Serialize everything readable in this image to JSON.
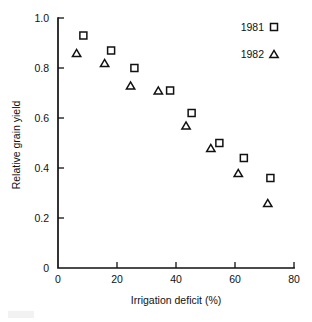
{
  "chart_data": {
    "type": "scatter",
    "title": "",
    "xlabel": "Irrigation deficit (%)",
    "ylabel": "Relative grain yield",
    "xlim": [
      0,
      80
    ],
    "ylim": [
      0,
      1.0
    ],
    "xticks": [
      0,
      20,
      40,
      60,
      80
    ],
    "xtick_labels": [
      "0",
      "20",
      "40",
      "60",
      "80"
    ],
    "yticks": [
      0,
      0.2,
      0.4,
      0.6,
      0.8,
      1.0
    ],
    "ytick_labels": [
      "0",
      "0.2",
      "0.4",
      "0.6",
      "0.8",
      "1.0"
    ],
    "grid": false,
    "legend_position": "top-right",
    "series": [
      {
        "name": "1981",
        "marker": "open-square",
        "points": [
          {
            "x": 8.6,
            "y": 0.93
          },
          {
            "x": 18.0,
            "y": 0.87
          },
          {
            "x": 25.9,
            "y": 0.8
          },
          {
            "x": 38.0,
            "y": 0.71
          },
          {
            "x": 45.3,
            "y": 0.62
          },
          {
            "x": 54.7,
            "y": 0.5
          },
          {
            "x": 63.0,
            "y": 0.44
          },
          {
            "x": 72.0,
            "y": 0.36
          }
        ]
      },
      {
        "name": "1982",
        "marker": "open-triangle",
        "points": [
          {
            "x": 6.3,
            "y": 0.86
          },
          {
            "x": 15.8,
            "y": 0.82
          },
          {
            "x": 24.6,
            "y": 0.73
          },
          {
            "x": 34.0,
            "y": 0.71
          },
          {
            "x": 43.4,
            "y": 0.57
          },
          {
            "x": 51.8,
            "y": 0.48
          },
          {
            "x": 61.1,
            "y": 0.38
          },
          {
            "x": 71.1,
            "y": 0.26
          }
        ]
      }
    ]
  },
  "legend": {
    "entries": [
      {
        "label": "1981",
        "marker": "open-square"
      },
      {
        "label": "1982",
        "marker": "open-triangle"
      }
    ]
  },
  "colors": {
    "axis": "#111111",
    "marker_stroke": "#111111",
    "background": "#ffffff"
  }
}
